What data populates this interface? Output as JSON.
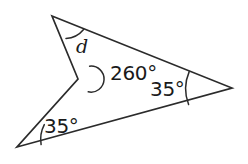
{
  "figure": {
    "type": "geometry-diagram",
    "background_color": "#ffffff",
    "stroke_color": "#2b2b2b",
    "text_color": "#1a1a1a",
    "vertices": [
      {
        "name": "top-vertex",
        "x": 52,
        "y": 16
      },
      {
        "name": "right-vertex",
        "x": 232,
        "y": 88
      },
      {
        "name": "bottom-left-vertex",
        "x": 17,
        "y": 147
      },
      {
        "name": "reflex-vertex",
        "x": 78,
        "y": 79
      }
    ],
    "path": "M 52 16 L 232 88 L 17 147 L 78 79 Z",
    "labels": {
      "reflex_angle": "260°",
      "right_angle": "35°",
      "left_angle": "35°",
      "unknown_angle": "d"
    },
    "angle_marks": [
      {
        "name": "top-vertex-arc",
        "vertex": "top-vertex",
        "value": "d"
      },
      {
        "name": "reflex-angle-arc",
        "vertex": "reflex-vertex",
        "value": "260°"
      },
      {
        "name": "right-vertex-arc",
        "vertex": "right-vertex",
        "value": "35°"
      },
      {
        "name": "left-vertex-arc",
        "vertex": "bottom-left-vertex",
        "value": "35°"
      }
    ]
  }
}
